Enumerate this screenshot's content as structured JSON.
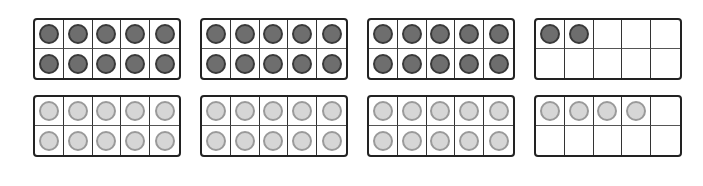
{
  "colors": {
    "dark_fill": "#6e6e6e",
    "dark_border": "#3a3a3a",
    "light_fill": "#d6d6d6",
    "light_border": "#9a9a9a",
    "frame_border": "#222222"
  },
  "rows": [
    {
      "name": "top-row",
      "counter_style": "dark",
      "frames": [
        {
          "filled": 10
        },
        {
          "filled": 10
        },
        {
          "filled": 10
        },
        {
          "filled": 2
        }
      ],
      "total": 32
    },
    {
      "name": "bottom-row",
      "counter_style": "light",
      "frames": [
        {
          "filled": 10
        },
        {
          "filled": 10
        },
        {
          "filled": 10
        },
        {
          "filled": 4
        }
      ],
      "total": 34
    }
  ]
}
